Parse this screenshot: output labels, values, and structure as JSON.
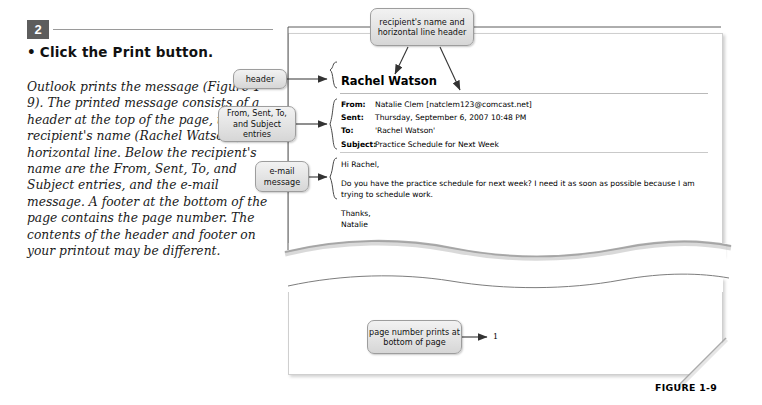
{
  "step": {
    "number": "2",
    "instruction_bullet": "•",
    "instruction": "Click the Print button.",
    "explanation": "Outlook prints the message (Figure 1-9). The printed message consists of a header at the top of the page, the recipient's name (Rachel Watson), and a horizontal line. Below the recipient's name are the From, Sent, To, and Subject entries, and the e-mail message. A footer at the bottom of the page contains the page number. The contents of the header and footer on your printout may be different."
  },
  "callouts": {
    "recipient": "recipient's name and horizontal line header",
    "header": "header",
    "fields": "From, Sent, To, and Subject entries",
    "email_message": "e-mail message",
    "page_number": "page number prints at bottom of page"
  },
  "printout": {
    "recipient_name": "Rachel Watson",
    "fields": [
      {
        "label": "From:",
        "value": "Natalie Clem [natclem123@comcast.net]"
      },
      {
        "label": "Sent:",
        "value": "Thursday, September 6, 2007 10:48 PM"
      },
      {
        "label": "To:",
        "value": "'Rachel Watson'"
      },
      {
        "label": "Subject:",
        "value": "Practice Schedule for Next Week"
      }
    ],
    "body": {
      "greeting": "Hi Rachel,",
      "paragraph": "Do you have the practice schedule for next week? I need it as soon as possible because I am trying to schedule work.",
      "closing": "Thanks,",
      "signature": "Natalie"
    },
    "page_number_value": "1"
  },
  "figure": {
    "caption": "FIGURE 1-9"
  },
  "colors": {
    "step_badge_bg": "#5d5d5d",
    "callout_border": "#9d9d9d",
    "callout_fill": "#e3e3e3",
    "rule": "#9a9a9a",
    "wire": "#4a4a4a"
  }
}
